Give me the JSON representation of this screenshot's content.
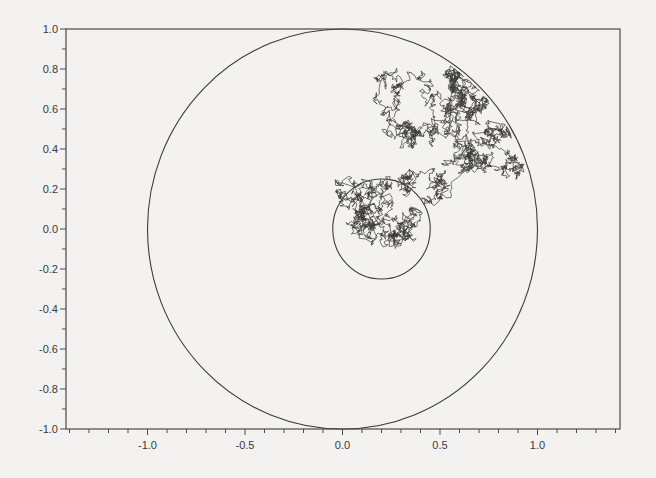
{
  "chart_data": {
    "type": "line",
    "title": "",
    "xlabel": "",
    "ylabel": "",
    "xlim": [
      -1.42,
      1.42
    ],
    "ylim": [
      -1.0,
      1.0
    ],
    "grid": false,
    "legend": null,
    "x_ticks": [
      -1.0,
      -0.5,
      0.0,
      0.5,
      1.0
    ],
    "x_tick_labels": [
      "-1.0",
      "-0.5",
      "0.0",
      "0.5",
      "1.0"
    ],
    "x_minor_step": 0.1,
    "y_ticks": [
      -1.0,
      -0.8,
      -0.6,
      -0.4,
      -0.2,
      0.0,
      0.2,
      0.4,
      0.6,
      0.8,
      1.0
    ],
    "y_tick_labels": [
      "-1.0",
      "-0.8",
      "-0.6",
      "-0.4",
      "-0.2",
      "0.0",
      "0.2",
      "0.4",
      "0.6",
      "0.8",
      "1.0"
    ],
    "y_minor_step": 0.1,
    "shapes": [
      {
        "name": "unit-circle",
        "type": "circle",
        "center": [
          0.0,
          0.0
        ],
        "radius": 1.0
      },
      {
        "name": "inner-circle",
        "type": "circle",
        "center": [
          0.2,
          0.0
        ],
        "radius": 0.25
      }
    ],
    "series": [
      {
        "name": "brownian-path",
        "description": "Random walk starting near (0.2, 0.0) inside the inner circle, exiting it and wandering until hitting the unit circle near (0.62, 0.78)",
        "start": [
          0.2,
          0.0
        ],
        "end": [
          0.62,
          0.78
        ],
        "extent": {
          "x": [
            0.07,
            0.9
          ],
          "y": [
            -0.07,
            0.8
          ]
        }
      }
    ]
  },
  "colors": {
    "background": "#f3f2f0",
    "axes": "#4a4a4a",
    "circle": "#3c3c3c",
    "path": "#3a3a3a"
  }
}
